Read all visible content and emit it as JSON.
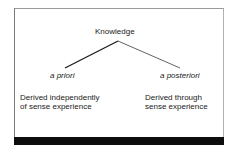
{
  "diagram": {
    "root": {
      "label": "Knowledge"
    },
    "branches": [
      {
        "label": "a priori",
        "description": {
          "line1": "Derived independently",
          "line2": "of sense experience"
        }
      },
      {
        "label": "a posteriori",
        "description": {
          "line1": "Derived through",
          "line2": "sense experience"
        }
      }
    ],
    "colors": {
      "text": "#1a1a1a",
      "connector_left": "#1a1a1a",
      "connector_right": "#3a3a3a",
      "footer_bar": "#0d0d0d",
      "frame_border": "#8a8a8a"
    }
  }
}
